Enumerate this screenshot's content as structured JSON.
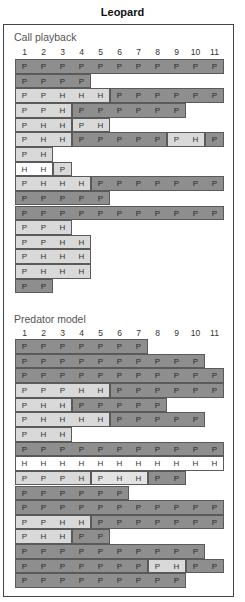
{
  "title": "Leopard",
  "columns": [
    "1",
    "2",
    "3",
    "4",
    "5",
    "6",
    "7",
    "8",
    "9",
    "10",
    "11"
  ],
  "colors": {
    "dark": "#8e8e8e",
    "light": "#d9d9d9",
    "lighter": "#e3e3e3",
    "white": "#ffffff",
    "border": "#5a5a5a"
  },
  "sections": [
    {
      "label": "Call playback",
      "rows": [
        [
          {
            "shade": "dark",
            "cells": [
              "P",
              "P",
              "P",
              "P",
              "P",
              "P",
              "P",
              "P",
              "P",
              "P",
              "P"
            ]
          }
        ],
        [
          {
            "shade": "dark",
            "cells": [
              "P",
              "P",
              "P",
              "P"
            ]
          }
        ],
        [
          {
            "shade": "light",
            "cells": [
              "P",
              "P",
              "H",
              "H",
              "H"
            ]
          },
          {
            "shade": "dark",
            "cells": [
              "P",
              "P",
              "P",
              "P",
              "P",
              "P"
            ]
          }
        ],
        [
          {
            "shade": "light",
            "cells": [
              "P",
              "P",
              "H"
            ]
          },
          {
            "shade": "dark",
            "cells": [
              "P",
              "P",
              "P",
              "P",
              "P",
              "P"
            ]
          }
        ],
        [
          {
            "shade": "light",
            "cells": [
              "P",
              "H",
              "H"
            ]
          },
          {
            "shade": "light",
            "cells": [
              "P",
              "H"
            ]
          }
        ],
        [
          {
            "shade": "light",
            "cells": [
              "P",
              "H",
              "H"
            ]
          },
          {
            "shade": "dark",
            "cells": [
              "P",
              "P",
              "P",
              "P",
              "P"
            ]
          },
          {
            "shade": "light",
            "cells": [
              "P",
              "H"
            ]
          },
          {
            "shade": "dark",
            "cells": [
              "P"
            ]
          }
        ],
        [
          {
            "shade": "light",
            "cells": [
              "P",
              "H"
            ]
          }
        ],
        [
          {
            "shade": "white",
            "cells": [
              "H",
              "H"
            ]
          },
          {
            "shade": "light",
            "cells": [
              "P"
            ]
          }
        ],
        [
          {
            "shade": "light",
            "cells": [
              "P",
              "H",
              "H",
              "H"
            ]
          },
          {
            "shade": "dark",
            "cells": [
              "P",
              "P",
              "P",
              "P",
              "P",
              "P",
              "P"
            ]
          }
        ],
        [
          {
            "shade": "dark",
            "cells": [
              "P",
              "P",
              "P",
              "P",
              "P"
            ]
          }
        ],
        [
          {
            "shade": "dark",
            "cells": [
              "P",
              "P",
              "P",
              "P",
              "P",
              "P",
              "P",
              "P",
              "P",
              "P",
              "P"
            ]
          }
        ],
        [
          {
            "shade": "light",
            "cells": [
              "P",
              "P",
              "H"
            ]
          }
        ],
        [
          {
            "shade": "light",
            "cells": [
              "P",
              "P",
              "H",
              "H"
            ]
          }
        ],
        [
          {
            "shade": "light",
            "cells": [
              "P",
              "H",
              "H",
              "H"
            ]
          }
        ],
        [
          {
            "shade": "light",
            "cells": [
              "P",
              "H",
              "H",
              "H"
            ]
          }
        ],
        [
          {
            "shade": "dark",
            "cells": [
              "P",
              "P"
            ]
          }
        ]
      ]
    },
    {
      "label": "Predator model",
      "rows": [
        [
          {
            "shade": "dark",
            "cells": [
              "P",
              "P",
              "P",
              "P",
              "P",
              "P",
              "P"
            ]
          }
        ],
        [
          {
            "shade": "dark",
            "cells": [
              "P",
              "P",
              "P",
              "P",
              "P",
              "P",
              "P",
              "P",
              "P",
              "P"
            ]
          }
        ],
        [
          {
            "shade": "dark",
            "cells": [
              "P",
              "P",
              "P",
              "P",
              "P",
              "P",
              "P",
              "P",
              "P",
              "P",
              "P"
            ]
          }
        ],
        [
          {
            "shade": "light",
            "cells": [
              "P",
              "P",
              "P",
              "H",
              "H"
            ]
          },
          {
            "shade": "dark",
            "cells": [
              "P",
              "P",
              "P",
              "P",
              "P",
              "P"
            ]
          }
        ],
        [
          {
            "shade": "light",
            "cells": [
              "P",
              "H",
              "H"
            ]
          },
          {
            "shade": "dark",
            "cells": [
              "P",
              "P",
              "P",
              "P",
              "P"
            ]
          }
        ],
        [
          {
            "shade": "light",
            "cells": [
              "P",
              "H",
              "H",
              "H",
              "H"
            ]
          },
          {
            "shade": "dark",
            "cells": [
              "P",
              "P",
              "P",
              "P",
              "P"
            ]
          }
        ],
        [
          {
            "shade": "light",
            "cells": [
              "P",
              "H",
              "H"
            ]
          }
        ],
        [
          {
            "shade": "dark",
            "cells": [
              "P",
              "P",
              "P",
              "P",
              "P",
              "P",
              "P",
              "P",
              "P",
              "P",
              "P"
            ]
          }
        ],
        [
          {
            "shade": "white",
            "cells": [
              "H",
              "H",
              "H",
              "H",
              "H",
              "H",
              "H",
              "H",
              "H",
              "H",
              "H"
            ]
          }
        ],
        [
          {
            "shade": "light",
            "cells": [
              "P",
              "P",
              "P",
              "H"
            ]
          },
          {
            "shade": "lighter",
            "cells": [
              "P",
              "H",
              "H"
            ]
          },
          {
            "shade": "dark",
            "cells": [
              "P",
              "P"
            ]
          }
        ],
        [
          {
            "shade": "dark",
            "cells": [
              "P",
              "P",
              "P",
              "P",
              "P",
              "P"
            ]
          }
        ],
        [
          {
            "shade": "dark",
            "cells": [
              "P",
              "P",
              "P",
              "P",
              "P",
              "P",
              "P",
              "P",
              "P",
              "P",
              "P"
            ]
          }
        ],
        [
          {
            "shade": "light",
            "cells": [
              "P",
              "P",
              "H",
              "H"
            ]
          },
          {
            "shade": "dark",
            "cells": [
              "P",
              "P",
              "P",
              "P",
              "P",
              "P",
              "P"
            ]
          }
        ],
        [
          {
            "shade": "light",
            "cells": [
              "P",
              "H",
              "H"
            ]
          },
          {
            "shade": "dark",
            "cells": [
              "P",
              "P"
            ]
          }
        ],
        [
          {
            "shade": "dark",
            "cells": [
              "P",
              "P",
              "P",
              "P",
              "P",
              "P",
              "P",
              "P",
              "P",
              "P"
            ]
          }
        ],
        [
          {
            "shade": "dark",
            "cells": [
              "P",
              "P",
              "P",
              "P",
              "P",
              "P",
              "P"
            ]
          },
          {
            "shade": "light",
            "cells": [
              "P",
              "H"
            ]
          },
          {
            "shade": "dark",
            "cells": [
              "P",
              "P"
            ]
          }
        ],
        [
          {
            "shade": "dark",
            "cells": [
              "P",
              "P",
              "P",
              "P",
              "P",
              "P",
              "P",
              "P",
              "P"
            ]
          }
        ]
      ]
    }
  ]
}
